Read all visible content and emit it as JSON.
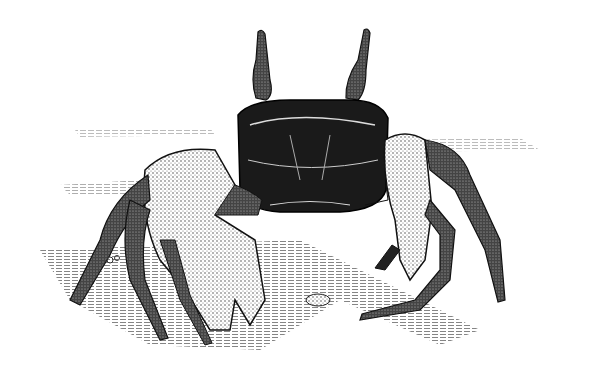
{
  "image": {
    "subject": "ghost crab illustration",
    "style": "black-and-white stipple drawing",
    "colors": {
      "background": "#ffffff",
      "ink": "#111111",
      "shade": "#444444",
      "light": "#bbbbbb"
    }
  }
}
